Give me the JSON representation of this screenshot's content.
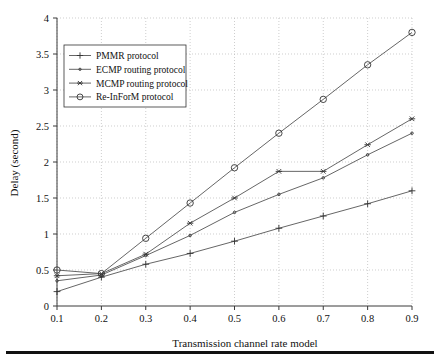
{
  "chart_data": {
    "type": "line",
    "title": "",
    "xlabel": "Transmission channel rate model",
    "ylabel": "Delay (second)",
    "x": [
      0.1,
      0.2,
      0.3,
      0.4,
      0.5,
      0.6,
      0.7,
      0.8,
      0.9
    ],
    "xlim": [
      0.1,
      0.9
    ],
    "ylim": [
      0,
      4
    ],
    "xticks": [
      "0.1",
      "0.2",
      "0.3",
      "0.4",
      "0.5",
      "0.6",
      "0.7",
      "0.8",
      "0.9"
    ],
    "yticks": [
      "0",
      "0.5",
      "1",
      "1.5",
      "2",
      "2.5",
      "3",
      "3.5",
      "4"
    ],
    "grid": true,
    "legend_position": "upper-left",
    "series": [
      {
        "name": "PMMR protocol",
        "marker": "plus",
        "values": [
          0.2,
          0.4,
          0.58,
          0.73,
          0.9,
          1.08,
          1.25,
          1.42,
          1.6
        ]
      },
      {
        "name": "ECMP routing protocol",
        "marker": "dot",
        "values": [
          0.35,
          0.43,
          0.7,
          0.98,
          1.3,
          1.55,
          1.78,
          2.1,
          2.4
        ]
      },
      {
        "name": "MCMP routing protocol",
        "marker": "asterisk",
        "values": [
          0.42,
          0.45,
          0.72,
          1.15,
          1.5,
          1.87,
          1.87,
          2.24,
          2.6
        ]
      },
      {
        "name": "Re-InForM protocol",
        "marker": "circle",
        "values": [
          0.5,
          0.45,
          0.94,
          1.43,
          1.92,
          2.4,
          2.87,
          3.35,
          3.8
        ]
      }
    ]
  },
  "colors": {
    "line": "#555555",
    "axis": "#3a3a3a",
    "grid": "#b9b9b9",
    "text": "#111111",
    "rule": "#111111"
  }
}
